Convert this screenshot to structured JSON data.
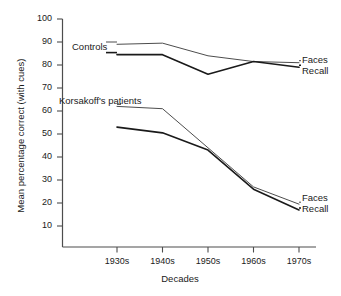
{
  "chart_data": {
    "type": "line",
    "title": "",
    "xlabel": "Decades",
    "ylabel": "Mean percentage correct (with cues)",
    "categories": [
      "1930s",
      "1940s",
      "1950s",
      "1960s",
      "1970s"
    ],
    "ylim": [
      0,
      100
    ],
    "yticks": [
      10,
      20,
      30,
      40,
      50,
      60,
      70,
      80,
      90,
      100
    ],
    "grid": false,
    "legend_position": "inline-annotations",
    "series": [
      {
        "name": "Controls Faces",
        "group": "Controls",
        "measure": "Faces",
        "values": [
          89,
          89.5,
          84,
          81.5,
          81
        ],
        "stroke": "#4d4d4d",
        "width": 1.0
      },
      {
        "name": "Controls Recall",
        "group": "Controls",
        "measure": "Recall",
        "values": [
          84.5,
          84.5,
          76,
          81.5,
          79
        ],
        "stroke": "#1a1a1a",
        "width": 1.6
      },
      {
        "name": "Korsakoff's patients Faces",
        "group": "Korsakoff's patients",
        "measure": "Faces",
        "values": [
          62,
          61,
          44,
          27,
          19.5
        ],
        "stroke": "#4d4d4d",
        "width": 1.0
      },
      {
        "name": "Korsakoff's patients Recall",
        "group": "Korsakoff's patients",
        "measure": "Recall",
        "values": [
          53,
          50.5,
          43,
          26,
          17
        ],
        "stroke": "#1a1a1a",
        "width": 1.6
      }
    ],
    "annotations": [
      {
        "id": "controls",
        "text": "Controls"
      },
      {
        "id": "korsakoff",
        "text": "Korsakoff's patients"
      },
      {
        "id": "top_faces",
        "text": "Faces"
      },
      {
        "id": "top_recall",
        "text": "Recall"
      },
      {
        "id": "bottom_faces",
        "text": "Faces"
      },
      {
        "id": "bottom_recall",
        "text": "Recall"
      }
    ]
  },
  "axes": {
    "y_tick_labels": [
      "100",
      "90",
      "80",
      "70",
      "60",
      "50",
      "40",
      "30",
      "20",
      "10"
    ],
    "x_tick_labels": [
      "1930s",
      "1940s",
      "1950s",
      "1960s",
      "1970s"
    ],
    "y_title": "Mean percentage correct (with cues)",
    "x_title": "Decades"
  },
  "colors": {
    "background": "#ffffff",
    "axis": "#4d4d4d",
    "text": "#1a1a1a",
    "series_thin": "#4d4d4d",
    "series_thick": "#1a1a1a"
  }
}
